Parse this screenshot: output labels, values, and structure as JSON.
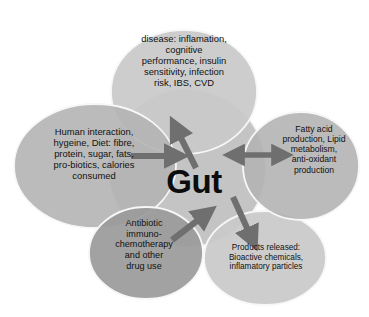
{
  "diagram": {
    "type": "venn-cluster",
    "center": {
      "label": "Gut"
    },
    "palette": {
      "background": "#ffffff",
      "center_circle": "#c4c4c4",
      "ellipse_light": "#c9c9c9",
      "ellipse_medium": "#b4b4b4",
      "ellipse_dark": "#9b9b9b",
      "outline": "#f2f2f2",
      "arrow": "#6f6f6f",
      "text": "#111111",
      "center_text": "#0c0c0c"
    },
    "nodes": [
      {
        "id": "top",
        "name": "disease-outcomes",
        "text": "disease: inflamation,\ncognitive\nperformance, insulin\nsensitivity, infection\nrisk,  IBS, CVD",
        "fill": "#c9c9c9"
      },
      {
        "id": "left",
        "name": "human-inputs",
        "text": "Human interaction,\nhygeine,  Diet: fibre,\nprotein, sugar, fats,\npro-biotics, calories\nconsumed",
        "fill": "#b4b4b4"
      },
      {
        "id": "right",
        "name": "metabolic-functions",
        "text": "Fatty acid\nproduction, Lipid\nmetabolism,\nanti-oxidant\nproduction",
        "fill": "#b4b4b4"
      },
      {
        "id": "bottom-left",
        "name": "drug-use",
        "text": "Antibiotic\nimmuno-\nchemotherapy\nand other\ndrug use",
        "fill": "#9b9b9b"
      },
      {
        "id": "bottom-right",
        "name": "products-released",
        "text": "Products released:\nBioactive chemicals,\ninflamatory particles",
        "fill": "#c9c9c9"
      }
    ],
    "arrows": [
      {
        "id": "left-to-gut",
        "name": "arrow-inputs-to-gut",
        "direction": "single",
        "from": "left",
        "to": "center"
      },
      {
        "id": "gut-to-disease",
        "name": "arrow-gut-to-disease",
        "direction": "single",
        "from": "center",
        "to": "top"
      },
      {
        "id": "gut-right",
        "name": "arrow-gut-metabolism-bidirectional",
        "direction": "double",
        "from": "center",
        "to": "right"
      },
      {
        "id": "drugs-to-gut",
        "name": "arrow-drugs-to-gut",
        "direction": "single",
        "from": "bottom-left",
        "to": "center"
      },
      {
        "id": "gut-to-products",
        "name": "arrow-gut-to-products",
        "direction": "single",
        "from": "center",
        "to": "bottom-right"
      }
    ]
  }
}
